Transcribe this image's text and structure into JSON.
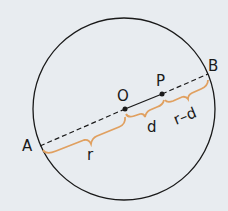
{
  "diagram": {
    "background": "#e8ecf0",
    "circle": {
      "cx": 124,
      "cy": 109,
      "r": 91,
      "stroke": "#1a1a1a"
    },
    "points": {
      "A": {
        "label": "A",
        "x": 40,
        "y": 146
      },
      "B": {
        "label": "B",
        "x": 208,
        "y": 73
      },
      "O": {
        "label": "O",
        "x": 125,
        "y": 109
      },
      "P": {
        "label": "P",
        "x": 162,
        "y": 94
      }
    },
    "segments": [
      {
        "from": "A",
        "to": "O",
        "style": "dashed"
      },
      {
        "from": "O",
        "to": "P",
        "style": "solid"
      },
      {
        "from": "P",
        "to": "B",
        "style": "dashed"
      }
    ],
    "braces": {
      "color": "#e0a060",
      "r": {
        "label": "r"
      },
      "d": {
        "label": "d"
      },
      "r_minus_d": {
        "label": "r–d"
      }
    }
  }
}
